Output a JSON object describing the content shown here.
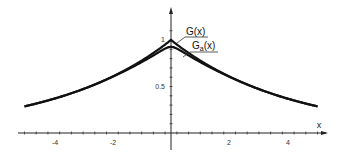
{
  "chart_data": {
    "type": "line",
    "title": "",
    "xlabel": "x",
    "ylabel": "",
    "xlim": [
      -5,
      5
    ],
    "ylim": [
      0,
      1.1
    ],
    "grid": false,
    "legend_position": "inline-annotations near peak (upper right of y-axis)",
    "x_ticks": [
      -4,
      -2,
      2,
      4
    ],
    "x_tick_labels": [
      "-4",
      "-2",
      "2",
      "4"
    ],
    "y_ticks": [
      0.5,
      1
    ],
    "y_tick_labels": [
      "0.5",
      "1"
    ],
    "x": [
      -5,
      -4,
      -3,
      -2,
      -1,
      -0.5,
      0,
      0.5,
      1,
      2,
      3,
      4,
      5
    ],
    "series": [
      {
        "name": "G(x)",
        "values": [
          0.29,
          0.37,
          0.47,
          0.61,
          0.78,
          0.88,
          1.0,
          0.88,
          0.78,
          0.61,
          0.47,
          0.37,
          0.29
        ]
      },
      {
        "name": "G_a(x)",
        "values": [
          0.29,
          0.37,
          0.47,
          0.6,
          0.75,
          0.85,
          0.98,
          0.85,
          0.75,
          0.6,
          0.47,
          0.37,
          0.29
        ]
      }
    ],
    "annotations": [
      "G(x)",
      "Ga(x)"
    ]
  },
  "labels": {
    "x_axis": "x",
    "y_tick_1": "1",
    "y_tick_05": "0.5",
    "x_tick_m4": "-4",
    "x_tick_m2": "-2",
    "x_tick_2": "2",
    "x_tick_4": "4",
    "legend_g": "G(x)",
    "legend_ga_main": "G",
    "legend_ga_sub": "a",
    "legend_ga_tail": "(x)"
  },
  "colors": {
    "curve": "#111111",
    "axis": "#222222",
    "background": "#ffffff"
  }
}
